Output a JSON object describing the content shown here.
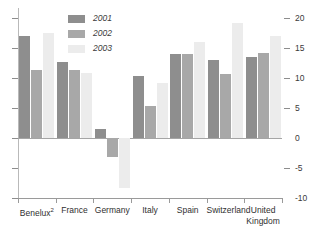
{
  "chart_data": {
    "type": "bar",
    "title": "",
    "subtitle": "",
    "xlabel": "",
    "ylabel": "",
    "ylim": [
      -10,
      20
    ],
    "yticks": [
      20,
      15,
      10,
      5,
      0,
      -5,
      -10
    ],
    "ytick_labels": [
      "20",
      "15",
      "10",
      "5",
      "0",
      "-5",
      "-10"
    ],
    "grid": false,
    "legend_position": "top-left",
    "axis_labels_side": "right",
    "categories": [
      "Benelux²",
      "France",
      "Germany",
      "Italy",
      "Spain",
      "Switzerland",
      "United Kingdom"
    ],
    "series": [
      {
        "name": "2001",
        "color": "#8e8e8e",
        "values": [
          17.0,
          12.7,
          1.5,
          10.3,
          14.0,
          13.0,
          13.5
        ]
      },
      {
        "name": "2002",
        "color": "#a8a8a8",
        "values": [
          11.3,
          11.3,
          -3.2,
          5.3,
          14.0,
          10.7,
          14.2
        ]
      },
      {
        "name": "2003",
        "color": "#ececec",
        "values": [
          17.5,
          10.8,
          -8.3,
          9.2,
          16.0,
          19.2,
          17.0
        ]
      }
    ]
  },
  "legend": {
    "items": [
      {
        "label": "2001"
      },
      {
        "label": "2002"
      },
      {
        "label": "2003"
      }
    ]
  },
  "axis": {
    "right_labels": [
      "20",
      "15",
      "10",
      "5",
      "0",
      "-5",
      "-10"
    ]
  },
  "categories_display": [
    {
      "main": "Benelux",
      "sup": "2",
      "line2": ""
    },
    {
      "main": "France",
      "sup": "",
      "line2": ""
    },
    {
      "main": "Germany",
      "sup": "",
      "line2": ""
    },
    {
      "main": "Italy",
      "sup": "",
      "line2": ""
    },
    {
      "main": "Spain",
      "sup": "",
      "line2": ""
    },
    {
      "main": "Switzerland",
      "sup": "",
      "line2": ""
    },
    {
      "main": "United",
      "sup": "",
      "line2": "Kingdom"
    }
  ]
}
